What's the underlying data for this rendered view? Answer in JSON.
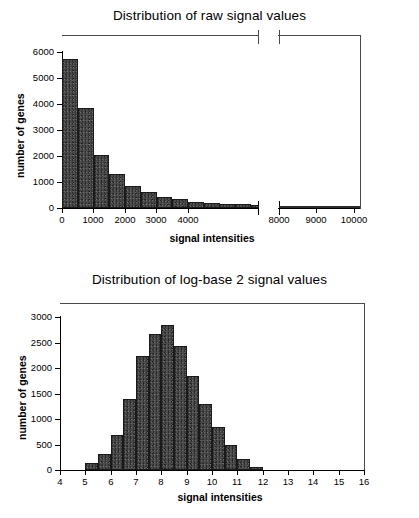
{
  "figure": {
    "caption_present": false
  },
  "charts": [
    {
      "id": "raw-signal-distribution",
      "title": "Distribution of raw signal values",
      "xlabel": "signal intensities",
      "ylabel": "number of genes",
      "x_ticks": [
        "0",
        "1000",
        "2000",
        "3000",
        "4000",
        "8000",
        "9000",
        "10000"
      ],
      "y_ticks": [
        "0",
        "1000",
        "2000",
        "3000",
        "4000",
        "5000",
        "6000"
      ]
    },
    {
      "id": "log2-signal-distribution",
      "title": "Distribution of log-base 2 signal values",
      "xlabel": "signal intensities",
      "ylabel": "number of genes",
      "x_ticks": [
        "4",
        "5",
        "6",
        "7",
        "8",
        "9",
        "10",
        "11",
        "12",
        "13",
        "14",
        "15",
        "16"
      ],
      "y_ticks": [
        "0",
        "500",
        "1000",
        "1500",
        "2000",
        "2500",
        "3000"
      ]
    }
  ],
  "chart_data": [
    {
      "type": "bar",
      "id": "raw-signal-distribution",
      "title": "Distribution of raw signal values",
      "xlabel": "signal intensities",
      "ylabel": "number of genes",
      "subtype": "histogram",
      "bin_width": 500,
      "axis_break": {
        "present": true,
        "from": 5000,
        "to": 7800,
        "note": "x-axis broken between ~5000 and ~7800"
      },
      "xlim": [
        0,
        10000
      ],
      "ylim": [
        0,
        6500
      ],
      "grid": false,
      "legend": null,
      "bin_edges": [
        0,
        500,
        1000,
        1500,
        2000,
        2500,
        3000,
        3500,
        4000,
        4500,
        5000
      ],
      "values": [
        5750,
        3850,
        2050,
        1300,
        850,
        620,
        430,
        330,
        250,
        200
      ],
      "tail_segment": {
        "x_range": [
          7800,
          10000
        ],
        "value": 30
      },
      "x_tick_values": [
        0,
        1000,
        2000,
        3000,
        4000,
        8000,
        9000,
        10000
      ],
      "y_tick_values": [
        0,
        1000,
        2000,
        3000,
        4000,
        5000,
        6000
      ]
    },
    {
      "type": "bar",
      "id": "log2-signal-distribution",
      "title": "Distribution of log-base 2 signal values",
      "xlabel": "signal intensities",
      "ylabel": "number of genes",
      "subtype": "histogram",
      "bin_width": 0.5,
      "xlim": [
        4,
        16
      ],
      "ylim": [
        0,
        3200
      ],
      "grid": false,
      "legend": null,
      "bin_edges": [
        5.0,
        5.5,
        6.0,
        6.5,
        7.0,
        7.5,
        8.0,
        8.5,
        9.0,
        9.5,
        10.0,
        10.5,
        11.0,
        11.5,
        12.0,
        12.5,
        13.0,
        13.5,
        14.0,
        14.5
      ],
      "values": [
        130,
        320,
        680,
        1390,
        2230,
        2660,
        2850,
        2440,
        1850,
        1300,
        850,
        500,
        210,
        50
      ],
      "x_tick_values": [
        4,
        5,
        6,
        7,
        8,
        9,
        10,
        11,
        12,
        13,
        14,
        15,
        16
      ],
      "y_tick_values": [
        0,
        500,
        1000,
        1500,
        2000,
        2500,
        3000
      ]
    }
  ]
}
